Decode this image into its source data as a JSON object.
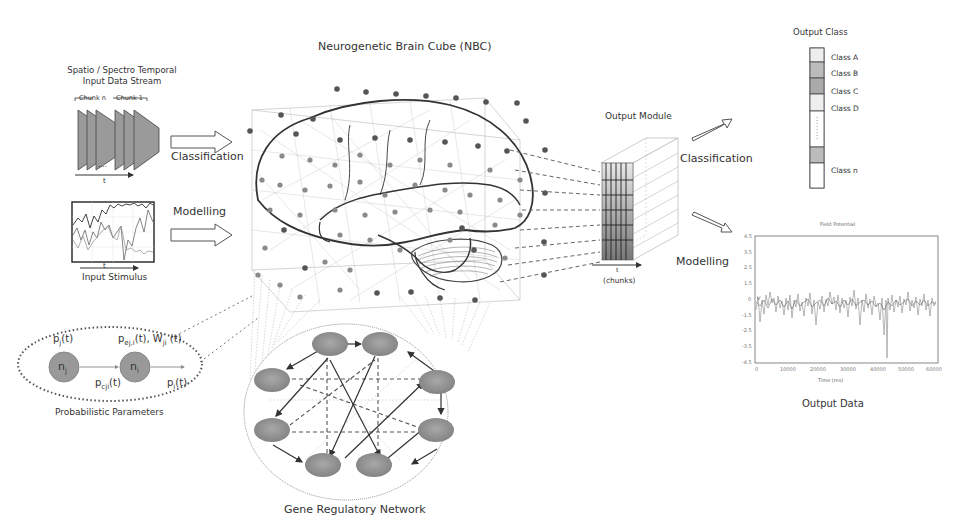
{
  "diagram": {
    "title": "Neurogenetic Brain Cube (NBC)",
    "input": {
      "stream_label": "Spatio / Spectro Temporal Input Data Stream",
      "chunk_labels": [
        "Chunk n",
        "Chunk 1"
      ],
      "time_axis": "t",
      "stimulus_label": "Input Stimulus"
    },
    "arrows": {
      "classification_in": "Classification",
      "modelling_in": "Modelling",
      "classification_out": "Classification",
      "modelling_out": "Modelling"
    },
    "neuron_detail": {
      "caption": "Probabilistic Parameters",
      "node_j": "n",
      "node_j_sub": "j",
      "node_i": "n",
      "node_i_sub": "i",
      "pj": "p",
      "pj_sub": "j",
      "pj_t": "(t)",
      "pe": "p",
      "pe_sub": "ej,i",
      "pe_t": "(t), W",
      "w_sub": "ji",
      "w_t": " (t)",
      "pc": "p",
      "pc_sub": "cji",
      "pc_t": "(t)",
      "pi": "p",
      "pi_sub": "i",
      "pi_t": "(t)"
    },
    "output_module": {
      "label": "Output Module",
      "time_axis": "t",
      "chunks_label": "(chunks)"
    },
    "output_class": {
      "title": "Output Class",
      "classes": [
        "Class A",
        "Class B",
        "Class C",
        "Class D",
        "Class n"
      ]
    },
    "output_data": {
      "label": "Output Data",
      "plot_title": "Field Potential",
      "xlabel": "Time (ms)",
      "ylabel": "V",
      "xticks": [
        "0",
        "10000",
        "20000",
        "30000",
        "40000",
        "50000",
        "60000"
      ],
      "yticks": [
        "4.5",
        "3.5",
        "2.5",
        "1.5",
        "0",
        "-1.5",
        "-2.5",
        "-3.5",
        "-4.5"
      ]
    },
    "gene_network": {
      "label": "Gene Regulatory Network",
      "node_count": 8
    }
  }
}
